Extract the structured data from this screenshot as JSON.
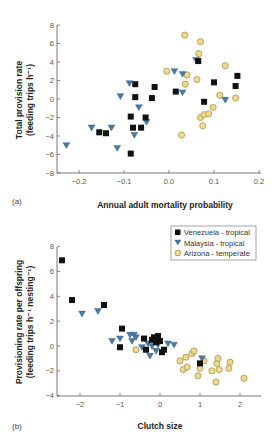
{
  "colors": {
    "venezuela": "#111111",
    "malaysia": "#4a7aa6",
    "arizona": "#efd98a",
    "arizona_stroke": "#8a7a3a",
    "axis": "#555555"
  },
  "legend": {
    "items": [
      {
        "label": "Venezuela - tropical",
        "marker": "square"
      },
      {
        "label": "Malaysia - tropical",
        "marker": "triangle-down"
      },
      {
        "label": "Arizona - temperate",
        "marker": "circle"
      }
    ]
  },
  "chart_data": [
    {
      "type": "scatter",
      "panel_label": "(a)",
      "title": "",
      "xlabel": "Annual adult mortality probability",
      "ylabel_line1": "Total provision rate",
      "ylabel_line2": "(feeding trips h⁻¹)",
      "xlim": [
        -0.25,
        0.2
      ],
      "ylim": [
        -8,
        8
      ],
      "xticks": [
        -0.2,
        -0.1,
        0.0,
        0.1,
        0.2
      ],
      "xtick_labels": [
        "−0.2",
        "−0.1",
        "0.0",
        "0.1",
        "0.2"
      ],
      "yticks": [
        -8,
        -6,
        -4,
        -2,
        0,
        2,
        4,
        6,
        8
      ],
      "ytick_labels": [
        "−8",
        "−6",
        "−4",
        "−2",
        "0",
        "2",
        "4",
        "6",
        "8"
      ],
      "grid": false,
      "series": [
        {
          "name": "Venezuela - tropical",
          "marker": "square",
          "points": [
            [
              -0.155,
              -3.6
            ],
            [
              -0.14,
              -3.7
            ],
            [
              -0.085,
              -1.9
            ],
            [
              -0.08,
              -3.1
            ],
            [
              -0.085,
              -5.9
            ],
            [
              -0.075,
              1.6
            ],
            [
              -0.075,
              0.2
            ],
            [
              -0.062,
              -3.1
            ],
            [
              -0.052,
              -2.0
            ],
            [
              -0.038,
              0.1
            ],
            [
              -0.032,
              1.3
            ],
            [
              0.015,
              0.8
            ],
            [
              0.065,
              4.1
            ],
            [
              0.078,
              -0.3
            ],
            [
              0.1,
              1.8
            ],
            [
              0.148,
              1.4
            ],
            [
              0.152,
              2.5
            ]
          ]
        },
        {
          "name": "Malaysia - tropical",
          "marker": "triangle-down",
          "points": [
            [
              -0.228,
              -5.0
            ],
            [
              -0.172,
              -3.1
            ],
            [
              -0.128,
              -3.1
            ],
            [
              -0.115,
              -5.3
            ],
            [
              -0.108,
              0.3
            ],
            [
              -0.088,
              1.7
            ],
            [
              -0.077,
              -3.9
            ],
            [
              -0.067,
              -0.9
            ],
            [
              -0.05,
              -2.5
            ],
            [
              0.012,
              3.0
            ],
            [
              0.03,
              0.7
            ],
            [
              0.03,
              2.7
            ],
            [
              0.06,
              4.2
            ],
            [
              0.125,
              -0.1
            ]
          ]
        },
        {
          "name": "Arizona - temperate",
          "marker": "circle",
          "points": [
            [
              -0.005,
              3.0
            ],
            [
              0.028,
              -3.9
            ],
            [
              0.035,
              6.9
            ],
            [
              0.036,
              1.6
            ],
            [
              0.04,
              2.6
            ],
            [
              0.062,
              2.1
            ],
            [
              0.066,
              4.9
            ],
            [
              0.07,
              6.2
            ],
            [
              0.07,
              -2.0
            ],
            [
              0.075,
              -2.9
            ],
            [
              0.078,
              -1.7
            ],
            [
              0.088,
              -1.6
            ],
            [
              0.098,
              -0.9
            ],
            [
              0.113,
              0.4
            ],
            [
              0.125,
              3.6
            ],
            [
              0.148,
              0.1
            ]
          ]
        }
      ]
    },
    {
      "type": "scatter",
      "panel_label": "(b)",
      "title": "",
      "xlabel": "Clutch size",
      "ylabel_line1": "Provisioning rate per offspring",
      "ylabel_line2": "(feeding trips h⁻¹ nesting⁻¹)",
      "xlim": [
        -2.6,
        2.5
      ],
      "ylim": [
        -4,
        8
      ],
      "xticks": [
        -2,
        -1,
        0,
        1,
        2
      ],
      "xtick_labels": [
        "−2",
        "−1",
        "0",
        "1",
        "2"
      ],
      "yticks": [
        -4,
        -2,
        0,
        2,
        4,
        6,
        8
      ],
      "ytick_labels": [
        "−4",
        "−2",
        "0",
        "2",
        "4",
        "6",
        "8"
      ],
      "grid": false,
      "legend_position": "upper right",
      "series": [
        {
          "name": "Venezuela - tropical",
          "marker": "square",
          "points": [
            [
              -2.45,
              6.9
            ],
            [
              -2.2,
              3.7
            ],
            [
              -1.4,
              3.3
            ],
            [
              -0.95,
              1.4
            ],
            [
              -1.0,
              -0.1
            ],
            [
              -0.4,
              0.6
            ],
            [
              -0.35,
              -0.3
            ],
            [
              -0.2,
              0.5
            ],
            [
              -0.15,
              0.7
            ],
            [
              -0.1,
              0.3
            ],
            [
              -0.05,
              0.8
            ],
            [
              0.0,
              0.4
            ],
            [
              0.05,
              -0.5
            ],
            [
              0.1,
              -0.3
            ],
            [
              1.0,
              -1.4
            ]
          ]
        },
        {
          "name": "Malaysia - tropical",
          "marker": "triangle-down",
          "points": [
            [
              -1.95,
              2.6
            ],
            [
              -1.55,
              2.8
            ],
            [
              -1.2,
              0.4
            ],
            [
              -1.0,
              0.6
            ],
            [
              -0.75,
              0.9
            ],
            [
              -0.7,
              0.4
            ],
            [
              -0.65,
              0.9
            ],
            [
              -0.6,
              0.7
            ],
            [
              -0.45,
              -0.1
            ],
            [
              -0.3,
              0.2
            ],
            [
              -0.25,
              -0.8
            ],
            [
              -0.2,
              0.0
            ],
            [
              -0.1,
              -0.4
            ],
            [
              -0.05,
              0.1
            ],
            [
              0.2,
              0.2
            ],
            [
              0.35,
              0.1
            ],
            [
              1.05,
              -1.0
            ]
          ]
        },
        {
          "name": "Arizona - temperate",
          "marker": "circle",
          "points": [
            [
              -0.6,
              -0.3
            ],
            [
              0.5,
              -1.2
            ],
            [
              0.58,
              -1.9
            ],
            [
              0.65,
              -0.9
            ],
            [
              0.68,
              -1.7
            ],
            [
              0.8,
              -0.6
            ],
            [
              0.85,
              -0.4
            ],
            [
              0.95,
              -2.4
            ],
            [
              1.0,
              -1.8
            ],
            [
              1.1,
              -1.2
            ],
            [
              1.3,
              -2.0
            ],
            [
              1.4,
              -2.9
            ],
            [
              1.42,
              -1.4
            ],
            [
              1.45,
              -1.0
            ],
            [
              1.48,
              -1.9
            ],
            [
              1.72,
              -1.8
            ],
            [
              1.75,
              -1.3
            ],
            [
              2.1,
              -2.6
            ]
          ]
        }
      ]
    }
  ]
}
